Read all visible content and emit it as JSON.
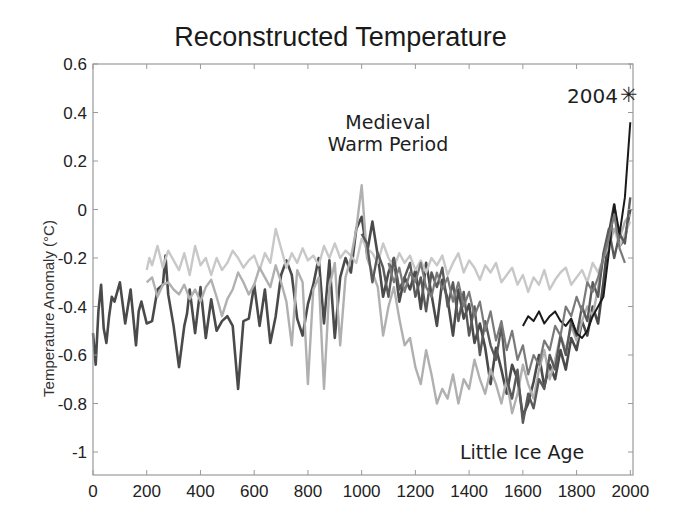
{
  "chart_data": {
    "type": "line",
    "title": "Reconstructed Temperature",
    "xlabel": "",
    "ylabel": "Temperature Anomaly (°C)",
    "xlim": [
      0,
      2010
    ],
    "ylim": [
      -1.1,
      0.6
    ],
    "xticks": [
      0,
      200,
      400,
      600,
      800,
      1000,
      1200,
      1400,
      1600,
      1800,
      2000
    ],
    "yticks": [
      0.6,
      0.4,
      0.2,
      0,
      -0.2,
      -0.4,
      -0.6,
      -0.8,
      -1
    ],
    "ytick_labels": [
      "0.6",
      "0.4",
      "0.2",
      "0",
      "-0.2",
      "-0.4",
      "-0.6",
      "-0.8",
      "-1"
    ],
    "grid": false,
    "legend": null,
    "annotations": [
      {
        "text": "Medieval",
        "x": 1090,
        "y": 0.38
      },
      {
        "text": "Warm Period",
        "x": 1090,
        "y": 0.25
      },
      {
        "text": "Little Ice Age",
        "x": 1700,
        "y": -1.0
      },
      {
        "text": "2004",
        "x": 1850,
        "y": 0.47
      },
      {
        "text": "✳",
        "marker": "star",
        "x": 2004,
        "y": 0.47
      }
    ],
    "series": [
      {
        "name": "reconstruction-1 (dark, full length)",
        "color": "#4a4a4a",
        "width": 2.6,
        "x": [
          0,
          10,
          20,
          30,
          40,
          50,
          60,
          70,
          80,
          100,
          120,
          140,
          160,
          170,
          180,
          200,
          220,
          240,
          260,
          270,
          280,
          300,
          320,
          340,
          350,
          360,
          380,
          400,
          420,
          440,
          460,
          480,
          500,
          520,
          540,
          560,
          580,
          600,
          620,
          640,
          660,
          680,
          700,
          720,
          740,
          760,
          780,
          800,
          820,
          840,
          860,
          880,
          900,
          920,
          940,
          960,
          980,
          1000,
          1020,
          1040,
          1060,
          1080,
          1100,
          1120,
          1140,
          1160,
          1180,
          1200,
          1220,
          1240,
          1260,
          1280,
          1300,
          1320,
          1340,
          1360,
          1380,
          1400,
          1420,
          1440,
          1460,
          1480,
          1500,
          1520,
          1540,
          1560,
          1580,
          1600,
          1620,
          1640,
          1660,
          1680,
          1700,
          1720,
          1740,
          1760,
          1780,
          1800,
          1820,
          1840,
          1860,
          1880,
          1900,
          1920,
          1940,
          1960,
          1980,
          2000
        ],
        "y": [
          -0.51,
          -0.64,
          -0.42,
          -0.31,
          -0.49,
          -0.55,
          -0.44,
          -0.36,
          -0.38,
          -0.3,
          -0.47,
          -0.33,
          -0.56,
          -0.42,
          -0.38,
          -0.47,
          -0.46,
          -0.33,
          -0.31,
          -0.19,
          -0.35,
          -0.48,
          -0.65,
          -0.48,
          -0.43,
          -0.33,
          -0.51,
          -0.32,
          -0.53,
          -0.37,
          -0.5,
          -0.46,
          -0.44,
          -0.48,
          -0.74,
          -0.46,
          -0.45,
          -0.31,
          -0.48,
          -0.33,
          -0.55,
          -0.44,
          -0.27,
          -0.21,
          -0.27,
          -0.45,
          -0.52,
          -0.39,
          -0.31,
          -0.2,
          -0.47,
          -0.21,
          -0.53,
          -0.28,
          -0.2,
          -0.26,
          -0.08,
          -0.03,
          -0.18,
          -0.05,
          -0.19,
          -0.36,
          -0.26,
          -0.2,
          -0.38,
          -0.28,
          -0.33,
          -0.25,
          -0.41,
          -0.22,
          -0.35,
          -0.48,
          -0.29,
          -0.37,
          -0.52,
          -0.33,
          -0.45,
          -0.39,
          -0.55,
          -0.47,
          -0.57,
          -0.72,
          -0.57,
          -0.66,
          -0.76,
          -0.64,
          -0.7,
          -0.85,
          -0.8,
          -0.71,
          -0.6,
          -0.73,
          -0.64,
          -0.7,
          -0.58,
          -0.66,
          -0.53,
          -0.58,
          -0.46,
          -0.52,
          -0.4,
          -0.47,
          -0.3,
          -0.1,
          0.02,
          -0.15,
          -0.12,
          0.0
        ]
      },
      {
        "name": "reconstruction-2 (light gray upper)",
        "color": "#c8c8c8",
        "width": 2.4,
        "x": [
          200,
          210,
          220,
          240,
          260,
          280,
          300,
          320,
          340,
          360,
          380,
          400,
          420,
          440,
          460,
          480,
          500,
          520,
          540,
          560,
          580,
          600,
          620,
          640,
          660,
          680,
          700,
          720,
          740,
          760,
          780,
          800,
          820,
          840,
          860,
          880,
          900,
          920,
          940,
          960,
          980,
          1000,
          1020,
          1040,
          1060,
          1080,
          1100,
          1120,
          1140,
          1160,
          1180,
          1200,
          1220,
          1240,
          1260,
          1280,
          1300,
          1320,
          1340,
          1360,
          1380,
          1400,
          1420,
          1440,
          1460,
          1480,
          1500,
          1520,
          1540,
          1560,
          1580,
          1600,
          1620,
          1640,
          1660,
          1680,
          1700,
          1720,
          1740,
          1760,
          1780,
          1800,
          1820,
          1840,
          1860,
          1880,
          1900,
          1920,
          1940,
          1960,
          1980,
          2000
        ],
        "y": [
          -0.25,
          -0.2,
          -0.23,
          -0.15,
          -0.24,
          -0.17,
          -0.21,
          -0.25,
          -0.18,
          -0.27,
          -0.15,
          -0.23,
          -0.2,
          -0.27,
          -0.2,
          -0.25,
          -0.22,
          -0.17,
          -0.2,
          -0.24,
          -0.21,
          -0.19,
          -0.25,
          -0.18,
          -0.22,
          -0.08,
          -0.16,
          -0.24,
          -0.18,
          -0.22,
          -0.16,
          -0.21,
          -0.19,
          -0.23,
          -0.15,
          -0.2,
          -0.14,
          -0.2,
          -0.17,
          -0.19,
          -0.22,
          -0.12,
          -0.16,
          -0.18,
          -0.22,
          -0.14,
          -0.2,
          -0.24,
          -0.18,
          -0.22,
          -0.19,
          -0.25,
          -0.21,
          -0.26,
          -0.2,
          -0.23,
          -0.19,
          -0.27,
          -0.22,
          -0.18,
          -0.26,
          -0.21,
          -0.24,
          -0.29,
          -0.23,
          -0.26,
          -0.22,
          -0.3,
          -0.27,
          -0.24,
          -0.31,
          -0.27,
          -0.34,
          -0.28,
          -0.31,
          -0.25,
          -0.33,
          -0.29,
          -0.26,
          -0.24,
          -0.31,
          -0.28,
          -0.25,
          -0.3,
          -0.22,
          -0.26,
          -0.2,
          -0.12,
          -0.08,
          -0.15,
          -0.1,
          -0.05
        ]
      },
      {
        "name": "reconstruction-3 (mid gray)",
        "color": "#b0b0b0",
        "width": 2.4,
        "x": [
          200,
          220,
          240,
          260,
          280,
          300,
          320,
          340,
          360,
          380,
          400,
          420,
          440,
          460,
          480,
          500,
          520,
          540,
          560,
          580,
          600,
          620,
          640,
          660,
          680,
          700,
          720,
          740,
          760,
          780,
          800,
          820,
          840,
          860,
          880,
          900,
          920,
          940,
          960,
          980,
          1000,
          1020,
          1040,
          1060,
          1080,
          1100,
          1120,
          1140,
          1160,
          1180,
          1200,
          1220,
          1240,
          1260,
          1280,
          1300,
          1320,
          1340,
          1360,
          1380,
          1400,
          1420,
          1440,
          1460,
          1480,
          1500,
          1520,
          1540,
          1560,
          1580,
          1600,
          1620,
          1640,
          1660,
          1680,
          1700,
          1720,
          1740,
          1760,
          1780,
          1800,
          1820,
          1840,
          1860,
          1880,
          1900,
          1920,
          1940,
          1960,
          1980,
          2000
        ],
        "y": [
          -0.3,
          -0.28,
          -0.36,
          -0.31,
          -0.3,
          -0.33,
          -0.35,
          -0.31,
          -0.37,
          -0.33,
          -0.38,
          -0.32,
          -0.29,
          -0.36,
          -0.44,
          -0.37,
          -0.33,
          -0.26,
          -0.3,
          -0.35,
          -0.31,
          -0.24,
          -0.28,
          -0.32,
          -0.23,
          -0.3,
          -0.38,
          -0.56,
          -0.25,
          -0.3,
          -0.72,
          -0.33,
          -0.28,
          -0.74,
          -0.32,
          -0.22,
          -0.56,
          -0.28,
          -0.2,
          -0.08,
          0.1,
          -0.2,
          -0.26,
          -0.32,
          -0.52,
          -0.4,
          -0.32,
          -0.45,
          -0.56,
          -0.53,
          -0.65,
          -0.72,
          -0.58,
          -0.68,
          -0.8,
          -0.74,
          -0.78,
          -0.68,
          -0.8,
          -0.7,
          -0.74,
          -0.62,
          -0.7,
          -0.76,
          -0.66,
          -0.72,
          -0.8,
          -0.7,
          -0.84,
          -0.76,
          -0.64,
          -0.72,
          -0.78,
          -0.66,
          -0.58,
          -0.7,
          -0.62,
          -0.52,
          -0.58,
          -0.48,
          -0.54,
          -0.46,
          -0.4,
          -0.44,
          -0.32,
          -0.2,
          -0.15,
          -0.08,
          -0.12,
          -0.05,
          -0.02
        ]
      },
      {
        "name": "reconstruction-4 (dark gray)",
        "color": "#5a5a5a",
        "width": 2.4,
        "x": [
          1000,
          1020,
          1040,
          1060,
          1080,
          1100,
          1120,
          1140,
          1160,
          1180,
          1200,
          1220,
          1240,
          1260,
          1280,
          1300,
          1320,
          1340,
          1360,
          1380,
          1400,
          1420,
          1440,
          1460,
          1480,
          1500,
          1520,
          1540,
          1560,
          1580,
          1600,
          1620,
          1640,
          1660,
          1680,
          1700,
          1720,
          1740,
          1760,
          1780,
          1800,
          1820,
          1840,
          1860,
          1880,
          1900,
          1920,
          1940,
          1960,
          1980,
          2000
        ],
        "y": [
          -0.1,
          -0.14,
          -0.3,
          -0.18,
          -0.24,
          -0.36,
          -0.2,
          -0.33,
          -0.28,
          -0.22,
          -0.36,
          -0.28,
          -0.42,
          -0.26,
          -0.32,
          -0.24,
          -0.4,
          -0.3,
          -0.46,
          -0.34,
          -0.52,
          -0.4,
          -0.6,
          -0.46,
          -0.56,
          -0.62,
          -0.48,
          -0.7,
          -0.78,
          -0.66,
          -0.88,
          -0.76,
          -0.82,
          -0.7,
          -0.74,
          -0.6,
          -0.66,
          -0.52,
          -0.6,
          -0.46,
          -0.52,
          -0.4,
          -0.46,
          -0.3,
          -0.36,
          -0.18,
          -0.08,
          -0.2,
          -0.1,
          -0.14,
          0.05
        ]
      },
      {
        "name": "reconstruction-5 (black smooth)",
        "color": "#1a1a1a",
        "width": 2.0,
        "x": [
          1600,
          1620,
          1640,
          1660,
          1680,
          1700,
          1720,
          1740,
          1760,
          1780,
          1800,
          1820,
          1840,
          1860,
          1880,
          1900,
          1920,
          1940,
          1960,
          1980,
          2000
        ],
        "y": [
          -0.48,
          -0.44,
          -0.46,
          -0.42,
          -0.47,
          -0.44,
          -0.42,
          -0.46,
          -0.48,
          -0.45,
          -0.51,
          -0.53,
          -0.5,
          -0.44,
          -0.4,
          -0.36,
          -0.18,
          0.02,
          -0.1,
          0.05,
          0.36
        ]
      },
      {
        "name": "reconstruction-6 (medium gray, late)",
        "color": "#7a7a7a",
        "width": 2.2,
        "x": [
          1100,
          1120,
          1140,
          1160,
          1180,
          1200,
          1220,
          1240,
          1260,
          1280,
          1300,
          1320,
          1340,
          1360,
          1380,
          1400,
          1420,
          1440,
          1460,
          1480,
          1500,
          1520,
          1540,
          1560,
          1580,
          1600,
          1620,
          1640,
          1660,
          1680,
          1700,
          1720,
          1740,
          1760,
          1780,
          1800,
          1820,
          1840,
          1860,
          1880,
          1900,
          1920,
          1940,
          1960,
          1980
        ],
        "y": [
          -0.22,
          -0.3,
          -0.24,
          -0.34,
          -0.26,
          -0.3,
          -0.22,
          -0.32,
          -0.36,
          -0.26,
          -0.33,
          -0.28,
          -0.38,
          -0.3,
          -0.4,
          -0.34,
          -0.44,
          -0.38,
          -0.5,
          -0.42,
          -0.54,
          -0.46,
          -0.58,
          -0.5,
          -0.62,
          -0.56,
          -0.68,
          -0.6,
          -0.64,
          -0.54,
          -0.58,
          -0.48,
          -0.52,
          -0.4,
          -0.44,
          -0.36,
          -0.42,
          -0.3,
          -0.34,
          -0.28,
          -0.2,
          -0.12,
          -0.02,
          -0.16,
          -0.22
        ]
      }
    ]
  }
}
